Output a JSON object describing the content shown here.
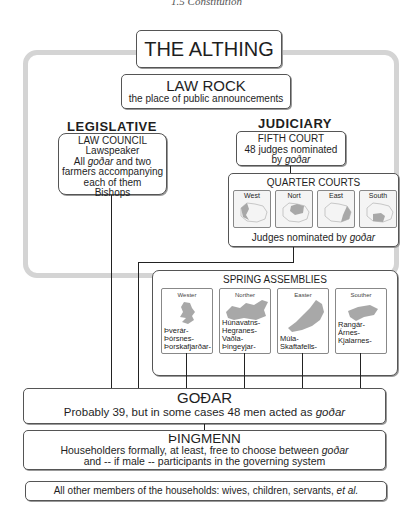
{
  "page_caption": "1.5 Constitution",
  "althing": {
    "title": "THE ALTHING"
  },
  "law_rock": {
    "title": "LAW ROCK",
    "subtitle": "the place of public announcements"
  },
  "legislative": {
    "heading": "LEGISLATIVE",
    "law_council": {
      "title": "LAW COUNCIL",
      "line1": "Lawspeaker",
      "line2_pre": "All ",
      "line2_em": "goðar",
      "line2_post": " and two",
      "line3": "farmers accompanying",
      "line4": "each of them",
      "line5": "Bishops"
    }
  },
  "judiciary": {
    "heading": "JUDICIARY",
    "fifth_court": {
      "title": "FIFTH COURT",
      "line1": "48 judges nominated",
      "line2_pre": "by ",
      "line2_em": "goðar"
    },
    "quarter_courts": {
      "title": "QUARTER COURTS",
      "quarters": [
        {
          "label": "West"
        },
        {
          "label": "Nort"
        },
        {
          "label": "East"
        },
        {
          "label": "South"
        }
      ],
      "footer_pre": "Judges nominated by ",
      "footer_em": "goðar"
    }
  },
  "spring_assemblies": {
    "title": "SPRING ASSEMBLIES",
    "assemblies": [
      {
        "header": "Wester",
        "lines": [
          "Þverár-",
          "Þórsnes-",
          "Þorskafjarðar-"
        ]
      },
      {
        "header": "Norther",
        "lines": [
          "Húnavatns-",
          "Hegranes-",
          "Vaðla-",
          "Þingeyjar-"
        ]
      },
      {
        "header": "Easter",
        "lines": [
          "Múla-",
          "Skaftafells-"
        ]
      },
      {
        "header": "Souther",
        "lines": [
          "Rangár-",
          "Árnes-",
          "Kjalarnes-"
        ]
      }
    ]
  },
  "godar": {
    "title": "GOÐAR",
    "text_pre": "Probably 39, but in some cases 48 men acted as ",
    "text_em": "goðar"
  },
  "thingmenn": {
    "title": "ÞINGMENN",
    "line1_pre": "Householders formally, at least, free to choose between ",
    "line1_em": "goðar",
    "line2": "and -- if male -- participants in the governing system"
  },
  "others": {
    "text_pre": "All other members of the households: wives, children, servants, ",
    "text_em": "et al."
  },
  "colors": {
    "frame": "#d4d4d4",
    "border": "#555555",
    "map_fill": "#a8a8a8",
    "map_bg": "#f4f4f4"
  }
}
